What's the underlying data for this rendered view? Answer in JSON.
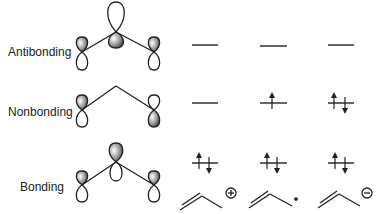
{
  "levels": [
    {
      "label": "Antibonding",
      "y": 45
    },
    {
      "label": "Nonbonding",
      "y": 103
    },
    {
      "label": "Bonding",
      "y": 163
    }
  ],
  "columns": [
    {
      "species": "allyl cation",
      "charge_symbol": "+",
      "electrons": {
        "antibonding": 0,
        "nonbonding": 0,
        "bonding": 2
      }
    },
    {
      "species": "allyl radical",
      "charge_symbol": "•",
      "electrons": {
        "antibonding": 0,
        "nonbonding": 1,
        "bonding": 2
      }
    },
    {
      "species": "allyl anion",
      "charge_symbol": "−",
      "electrons": {
        "antibonding": 0,
        "nonbonding": 2,
        "bonding": 2
      }
    }
  ],
  "colors": {
    "line": "#222222",
    "lobe_shaded_dark": "#444444",
    "lobe_shaded_light": "#ffffff"
  }
}
